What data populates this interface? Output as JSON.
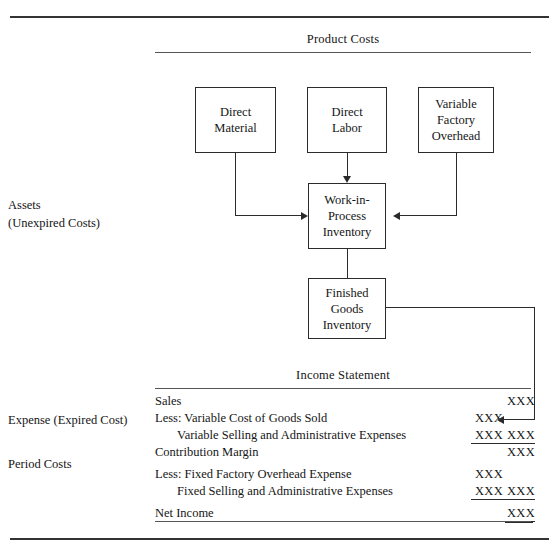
{
  "figure": {
    "sections": {
      "product_costs_heading": "Product Costs",
      "income_statement_heading": "Income Statement"
    },
    "margin_labels": {
      "assets": "Assets\n(Unexpired Costs)",
      "expense": "Expense (Expired Cost)",
      "period_costs": "Period Costs"
    },
    "nodes": {
      "direct_material": "Direct\nMaterial",
      "direct_labor": "Direct\nLabor",
      "variable_factory_overhead": "Variable\nFactory\nOverhead",
      "work_in_process": "Work-in-\nProcess\nInventory",
      "finished_goods": "Finished\nGoods\nInventory"
    },
    "income_statement": {
      "rows": [
        {
          "label": "Sales",
          "indent": false,
          "col1": "",
          "col2": "XXX",
          "col1_rule": "none",
          "col2_rule": "none"
        },
        {
          "label": "Less: Variable Cost of Goods Sold",
          "indent": false,
          "col1": "XXX",
          "col2": "",
          "col1_rule": "none",
          "col2_rule": "none"
        },
        {
          "label": "Variable Selling and Administrative Expenses",
          "indent": true,
          "col1": "XXX",
          "col2": "XXX",
          "col1_rule": "single",
          "col2_rule": "single"
        },
        {
          "label": "Contribution Margin",
          "indent": false,
          "col1": "",
          "col2": "XXX",
          "col1_rule": "none",
          "col2_rule": "none"
        },
        {
          "label": "Less: Fixed Factory Overhead Expense",
          "indent": false,
          "col1": "XXX",
          "col2": "",
          "col1_rule": "none",
          "col2_rule": "none"
        },
        {
          "label": "Fixed Selling and Administrative Expenses",
          "indent": true,
          "col1": "XXX",
          "col2": "XXX",
          "col1_rule": "single",
          "col2_rule": "single"
        },
        {
          "label": "Net Income",
          "indent": false,
          "col1": "",
          "col2": "XXX",
          "col1_rule": "none",
          "col2_rule": "double"
        }
      ]
    },
    "colors": {
      "ink": "#2b2b2b",
      "rule": "#3a3a3a",
      "background": "#ffffff"
    }
  }
}
